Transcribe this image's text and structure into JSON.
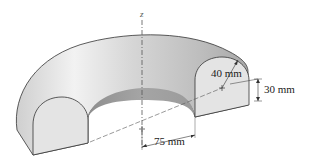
{
  "figure": {
    "type": "half-torus solid with dimensions",
    "axis_label": "z",
    "dimensions": {
      "radius": "40 mm",
      "height": "30 mm",
      "centroid_radius": "75 mm"
    },
    "colors": {
      "surface_light": "#ededed",
      "surface_mid": "#c9c9c9",
      "surface_dark": "#9a9a9a",
      "section_face": "#e4e4e4",
      "outline": "#333333"
    }
  }
}
